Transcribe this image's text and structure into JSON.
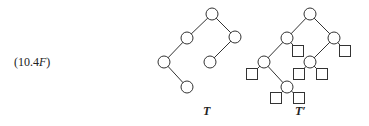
{
  "equation_label": {
    "prefix": "(10.4",
    "italic": "F",
    "suffix": ")"
  },
  "trees": [
    {
      "label": "T",
      "label_pos": [
        203,
        104
      ],
      "internal_nodes": [
        {
          "id": "root",
          "x": 212,
          "y": 14
        },
        {
          "id": "L",
          "x": 187,
          "y": 38
        },
        {
          "id": "R",
          "x": 235,
          "y": 37
        },
        {
          "id": "LL",
          "x": 164,
          "y": 62
        },
        {
          "id": "RL",
          "x": 210,
          "y": 62
        },
        {
          "id": "LLR",
          "x": 187,
          "y": 87
        }
      ],
      "edges": [
        [
          "root",
          "L"
        ],
        [
          "root",
          "R"
        ],
        [
          "L",
          "LL"
        ],
        [
          "R",
          "RL"
        ],
        [
          "LL",
          "LLR"
        ]
      ],
      "external_nodes": []
    },
    {
      "label": "T′",
      "label_pos": [
        295,
        104
      ],
      "internal_nodes": [
        {
          "id": "root",
          "x": 310,
          "y": 14
        },
        {
          "id": "L",
          "x": 287,
          "y": 38
        },
        {
          "id": "R",
          "x": 334,
          "y": 38
        },
        {
          "id": "LL",
          "x": 264,
          "y": 62
        },
        {
          "id": "RL",
          "x": 310,
          "y": 62
        },
        {
          "id": "LLR",
          "x": 287,
          "y": 87
        }
      ],
      "edges": [
        [
          "root",
          "L"
        ],
        [
          "root",
          "R"
        ],
        [
          "L",
          "LL"
        ],
        [
          "R",
          "RL"
        ],
        [
          "LL",
          "LLR"
        ]
      ],
      "external_nodes": [
        {
          "parent": "L",
          "x": 298,
          "y": 51
        },
        {
          "parent": "R",
          "x": 345,
          "y": 51
        },
        {
          "parent": "LL",
          "x": 252,
          "y": 74
        },
        {
          "parent": "RL",
          "x": 299,
          "y": 74
        },
        {
          "parent": "RL",
          "x": 322,
          "y": 74
        },
        {
          "parent": "LLR",
          "x": 276,
          "y": 98
        },
        {
          "parent": "LLR",
          "x": 299,
          "y": 98
        }
      ]
    }
  ],
  "style": {
    "node_radius": 6,
    "leaf_size": 11,
    "stroke": "#333333"
  }
}
